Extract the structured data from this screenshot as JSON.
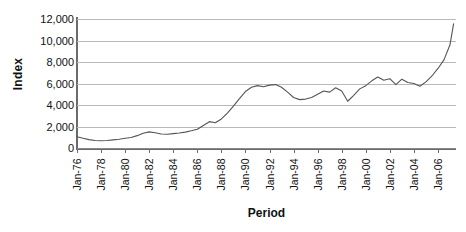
{
  "chart_data": {
    "type": "line",
    "title": "",
    "xlabel": "Period",
    "ylabel": "Index",
    "grid": true,
    "legend": "none",
    "ylim": [
      0,
      12000
    ],
    "ytick_step": 2000,
    "ytick_labels": [
      "12,000",
      "10,000",
      "8,000",
      "6,000",
      "4,000",
      "2,000",
      "0"
    ],
    "ytick_values": [
      12000,
      10000,
      8000,
      6000,
      4000,
      2000,
      0
    ],
    "xlim": [
      "Jan-76",
      "Jan-07"
    ],
    "xtick_labels": [
      "Jan-76",
      "Jan-78",
      "Jan-80",
      "Jan-82",
      "Jan-84",
      "Jan-86",
      "Jan-88",
      "Jan-90",
      "Jan-92",
      "Jan-94",
      "Jan-96",
      "Jan-98",
      "Jan-00",
      "Jan-02",
      "Jan-04",
      "Jan-06"
    ],
    "series": [
      {
        "name": "Index",
        "color": "#555555",
        "x": [
          1976.0,
          1976.5,
          1977.0,
          1977.5,
          1978.0,
          1978.5,
          1979.0,
          1979.5,
          1980.0,
          1980.5,
          1981.0,
          1981.5,
          1982.0,
          1982.5,
          1983.0,
          1983.5,
          1984.0,
          1984.5,
          1985.0,
          1985.5,
          1986.0,
          1986.5,
          1987.0,
          1987.5,
          1988.0,
          1988.5,
          1989.0,
          1989.5,
          1990.0,
          1990.5,
          1991.0,
          1991.5,
          1992.0,
          1992.5,
          1993.0,
          1993.5,
          1994.0,
          1994.5,
          1995.0,
          1995.5,
          1996.0,
          1996.5,
          1997.0,
          1997.5,
          1998.0,
          1998.5,
          1999.0,
          1999.5,
          2000.0,
          2000.5,
          2001.0,
          2001.5,
          2002.0,
          2002.5,
          2003.0,
          2003.5,
          2004.0,
          2004.5,
          2005.0,
          2005.5,
          2006.0,
          2006.5,
          2007.0,
          2007.3
        ],
        "values": [
          1050,
          900,
          780,
          700,
          680,
          700,
          760,
          820,
          900,
          980,
          1150,
          1380,
          1500,
          1420,
          1300,
          1280,
          1340,
          1400,
          1480,
          1600,
          1750,
          2100,
          2450,
          2350,
          2700,
          3250,
          3900,
          4600,
          5250,
          5650,
          5800,
          5700,
          5850,
          5900,
          5650,
          5200,
          4700,
          4500,
          4550,
          4700,
          5000,
          5300,
          5200,
          5600,
          5300,
          4350,
          4900,
          5500,
          5800,
          6250,
          6600,
          6300,
          6450,
          5900,
          6400,
          6100,
          6000,
          5750,
          6150,
          6700,
          7400,
          8200,
          9600,
          11550
        ]
      }
    ]
  }
}
